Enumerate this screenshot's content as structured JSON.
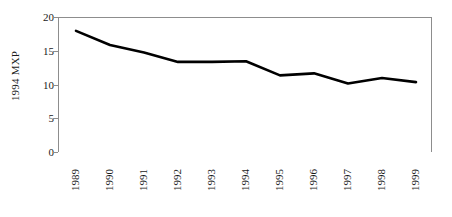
{
  "chart_data": {
    "type": "line",
    "title": "",
    "xlabel": "",
    "ylabel": "1994 MXP",
    "categories": [
      "1989",
      "1990",
      "1991",
      "1992",
      "1993",
      "1994",
      "1995",
      "1996",
      "1997",
      "1998",
      "1999"
    ],
    "values": [
      18.1,
      16.0,
      14.9,
      13.5,
      13.5,
      13.6,
      11.5,
      11.8,
      10.3,
      11.1,
      10.5
    ],
    "series": [
      {
        "name": "1994 MXP",
        "values": [
          18.1,
          16.0,
          14.9,
          13.5,
          13.5,
          13.6,
          11.5,
          11.8,
          10.3,
          11.1,
          10.5
        ]
      }
    ],
    "ylim": [
      0,
      20
    ],
    "yticks": [
      0,
      5,
      10,
      15,
      20
    ],
    "ytick_labels": [
      "0",
      "5",
      "10",
      "15",
      "20"
    ],
    "grid": false,
    "legend": false,
    "legend_position": "none",
    "line_color": "#000000",
    "frame_color": "#8d8d8d",
    "background_color": "#ffffff"
  }
}
